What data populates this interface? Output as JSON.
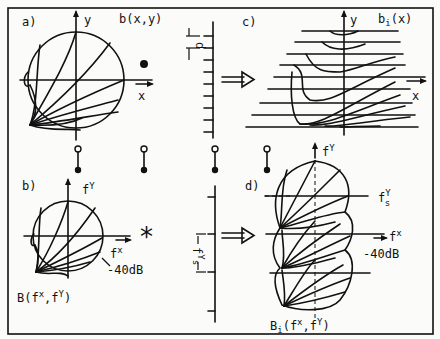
{
  "figure": {
    "panels": {
      "a": {
        "tag": "a)",
        "title": "b(x,y)",
        "axis_x": "x",
        "axis_y": "y"
      },
      "b": {
        "tag": "b)",
        "title": "B(f",
        "title_sup1": "x",
        "title_mid": ",f",
        "title_sup2": "Y",
        "title_end": ")",
        "axis_x": "f",
        "axis_x_sup": "x",
        "axis_y": "f",
        "axis_y_sup": "Y",
        "level": "-40dB"
      },
      "c": {
        "tag": "c)",
        "title": "b",
        "title_sub": "i",
        "title_end": "(x)",
        "axis_x": "x",
        "axis_y": "y",
        "spacing": "d"
      },
      "d": {
        "tag": "d)",
        "title": "B",
        "title_sub": "i",
        "title_mid": "(f",
        "title_sup1": "x",
        "title_mid2": ",f",
        "title_sup2": "Y",
        "title_end": ")",
        "axis_x": "f",
        "axis_x_sup": "x",
        "axis_y": "f",
        "axis_y_sup": "Y",
        "fs": "f",
        "fs_sup": "Y",
        "fs_sub": "s",
        "level": "-40dB"
      }
    },
    "operators": {
      "multiply_symbol": "dot",
      "convolve_symbol": "*",
      "arrow_top": "double-arrow-right",
      "arrow_bottom": "double-arrow-right"
    },
    "sampling_comb": {
      "spacing_label": "d",
      "ticks": 10
    },
    "spectral_comb": {
      "spacing_label": "f",
      "spacing_sup": "Y",
      "spacing_sub": "s",
      "ticks": 4
    },
    "fourier_pairs": 4
  }
}
